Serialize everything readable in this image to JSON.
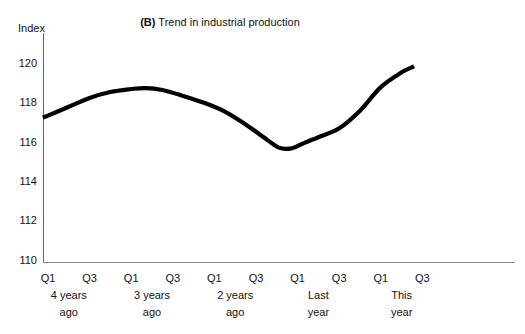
{
  "figure": {
    "title_prefix": "(B)",
    "title_rest": " Trend in industrial production",
    "y_axis_unit": "Index"
  },
  "chart_data": {
    "type": "line",
    "title": "(B) Trend in industrial production",
    "ylabel": "Index",
    "xlabel": "",
    "ylim": [
      110,
      121
    ],
    "grid": false,
    "legend": false,
    "y_ticks": [
      120,
      118,
      116,
      114,
      112,
      110
    ],
    "x_tick_labels": [
      "Q1",
      "Q3",
      "Q1",
      "Q3",
      "Q1",
      "Q3",
      "Q1",
      "Q3",
      "Q1",
      "Q3"
    ],
    "x_group_labels": [
      [
        "4 years",
        "ago"
      ],
      [
        "3 years",
        "ago"
      ],
      [
        "2 years",
        "ago"
      ],
      [
        "Last",
        "year"
      ],
      [
        "This",
        "year"
      ]
    ],
    "series": [
      {
        "name": "Industrial production trend",
        "color": "#000000",
        "points": [
          [
            -0.25,
            117.25
          ],
          [
            0,
            117.35
          ],
          [
            1,
            117.8
          ],
          [
            2,
            118.25
          ],
          [
            3,
            118.55
          ],
          [
            4,
            118.7
          ],
          [
            4.7,
            118.75
          ],
          [
            5.5,
            118.65
          ],
          [
            6.5,
            118.35
          ],
          [
            7.5,
            118.0
          ],
          [
            8.5,
            117.55
          ],
          [
            9.5,
            116.9
          ],
          [
            10.3,
            116.3
          ],
          [
            11.1,
            115.72
          ],
          [
            11.7,
            115.68
          ],
          [
            12.3,
            115.95
          ],
          [
            13,
            116.25
          ],
          [
            14,
            116.7
          ],
          [
            15,
            117.6
          ],
          [
            16,
            118.8
          ],
          [
            17,
            119.55
          ],
          [
            17.6,
            119.85
          ]
        ]
      }
    ]
  },
  "colors": {
    "background": "#ffffff",
    "text": "#111111",
    "axis": "#666666",
    "line": "#000000"
  }
}
